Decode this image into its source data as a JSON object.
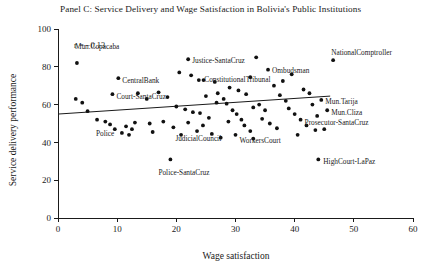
{
  "chart_data": {
    "type": "scatter",
    "title": "Panel C: Service Delivery and Wage Satisfaction in Bolivia's Public Institutions",
    "xlabel": "Wage satisfaction",
    "ylabel": "Service delivery performance",
    "xlim": [
      0,
      60
    ],
    "ylim": [
      0,
      100
    ],
    "xticks": [
      0,
      10,
      20,
      30,
      40,
      50,
      60
    ],
    "yticks": [
      0,
      20,
      40,
      60,
      80,
      100
    ],
    "grid": false,
    "legend": "none",
    "annotation": "r = −0.13",
    "trendline": {
      "x0": 0.0,
      "y0": 55.0,
      "x1": 46.0,
      "y1": 64.5
    },
    "points": [
      {
        "x": 3.2,
        "y": 82.0,
        "label": "Mun.Copacaba",
        "label_dx": -2,
        "label_dy": -17,
        "label_anchor": "start"
      },
      {
        "x": 3.0,
        "y": 63.0,
        "label": "",
        "label_dx": 0,
        "label_dy": 0,
        "label_anchor": "start"
      },
      {
        "x": 4.1,
        "y": 61.0,
        "label": "",
        "label_dx": 0,
        "label_dy": 0,
        "label_anchor": "start"
      },
      {
        "x": 5.0,
        "y": 56.5,
        "label": "",
        "label_dx": 0,
        "label_dy": 0,
        "label_anchor": "start"
      },
      {
        "x": 6.6,
        "y": 52.0,
        "label": "Police",
        "label_dx": -1,
        "label_dy": 14,
        "label_anchor": "start"
      },
      {
        "x": 8.0,
        "y": 51.0,
        "label": "",
        "label_dx": 0,
        "label_dy": 0,
        "label_anchor": "start"
      },
      {
        "x": 8.8,
        "y": 49.5,
        "label": "",
        "label_dx": 0,
        "label_dy": 0,
        "label_anchor": "start"
      },
      {
        "x": 9.6,
        "y": 47.0,
        "label": "",
        "label_dx": 0,
        "label_dy": 0,
        "label_anchor": "start"
      },
      {
        "x": 10.8,
        "y": 45.0,
        "label": "",
        "label_dx": 0,
        "label_dy": 0,
        "label_anchor": "start"
      },
      {
        "x": 10.2,
        "y": 74.0,
        "label": "CentralBank",
        "label_dx": 4,
        "label_dy": 2,
        "label_anchor": "start"
      },
      {
        "x": 9.2,
        "y": 65.5,
        "label": "Court-SantaCruz",
        "label_dx": 4,
        "label_dy": 2,
        "label_anchor": "start"
      },
      {
        "x": 13.0,
        "y": 50.5,
        "label": "",
        "label_dx": 0,
        "label_dy": 0,
        "label_anchor": "start"
      },
      {
        "x": 15.5,
        "y": 50.0,
        "label": "",
        "label_dx": 0,
        "label_dy": 0,
        "label_anchor": "start"
      },
      {
        "x": 17.8,
        "y": 51.0,
        "label": "",
        "label_dx": 0,
        "label_dy": 0,
        "label_anchor": "start"
      },
      {
        "x": 19.5,
        "y": 48.0,
        "label": "JudicialCouncil",
        "label_dx": 2,
        "label_dy": 11,
        "label_anchor": "start"
      },
      {
        "x": 20.5,
        "y": 77.0,
        "label": "",
        "label_dx": 0,
        "label_dy": 0,
        "label_anchor": "start"
      },
      {
        "x": 22.5,
        "y": 75.5,
        "label": "",
        "label_dx": 0,
        "label_dy": 0,
        "label_anchor": "start"
      },
      {
        "x": 23.8,
        "y": 73.0,
        "label": "",
        "label_dx": 0,
        "label_dy": 0,
        "label_anchor": "start"
      },
      {
        "x": 24.6,
        "y": 73.0,
        "label": "",
        "label_dx": 0,
        "label_dy": 0,
        "label_anchor": "start"
      },
      {
        "x": 22.0,
        "y": 84.0,
        "label": "Justice-SantaCruz",
        "label_dx": 4,
        "label_dy": 1,
        "label_anchor": "start"
      },
      {
        "x": 26.5,
        "y": 72.0,
        "label": "",
        "label_dx": 0,
        "label_dy": 0,
        "label_anchor": "start"
      },
      {
        "x": 27.0,
        "y": 66.0,
        "label": "",
        "label_dx": 0,
        "label_dy": 0,
        "label_anchor": "start"
      },
      {
        "x": 28.0,
        "y": 63.0,
        "label": "",
        "label_dx": 0,
        "label_dy": 0,
        "label_anchor": "start"
      },
      {
        "x": 28.5,
        "y": 60.5,
        "label": "",
        "label_dx": 0,
        "label_dy": 0,
        "label_anchor": "start"
      },
      {
        "x": 29.5,
        "y": 57.0,
        "label": "",
        "label_dx": 0,
        "label_dy": 0,
        "label_anchor": "start"
      },
      {
        "x": 30.2,
        "y": 55.0,
        "label": "",
        "label_dx": 0,
        "label_dy": 0,
        "label_anchor": "start"
      },
      {
        "x": 31.0,
        "y": 52.0,
        "label": "",
        "label_dx": 0,
        "label_dy": 0,
        "label_anchor": "start"
      },
      {
        "x": 31.5,
        "y": 49.0,
        "label": "",
        "label_dx": 0,
        "label_dy": 0,
        "label_anchor": "start"
      },
      {
        "x": 32.5,
        "y": 46.0,
        "label": "",
        "label_dx": 0,
        "label_dy": 0,
        "label_anchor": "start"
      },
      {
        "x": 30.0,
        "y": 44.0,
        "label": "WorkersCourt",
        "label_dx": 4,
        "label_dy": 6,
        "label_anchor": "start"
      },
      {
        "x": 33.0,
        "y": 42.0,
        "label": "",
        "label_dx": 0,
        "label_dy": 0,
        "label_anchor": "start"
      },
      {
        "x": 25.5,
        "y": 53.0,
        "label": "",
        "label_dx": 0,
        "label_dy": 0,
        "label_anchor": "start"
      },
      {
        "x": 24.0,
        "y": 55.5,
        "label": "",
        "label_dx": 0,
        "label_dy": 0,
        "label_anchor": "start"
      },
      {
        "x": 22.8,
        "y": 56.0,
        "label": "",
        "label_dx": 0,
        "label_dy": 0,
        "label_anchor": "start"
      },
      {
        "x": 21.5,
        "y": 57.5,
        "label": "",
        "label_dx": 0,
        "label_dy": 0,
        "label_anchor": "start"
      },
      {
        "x": 20.0,
        "y": 59.0,
        "label": "",
        "label_dx": 0,
        "label_dy": 0,
        "label_anchor": "start"
      },
      {
        "x": 26.0,
        "y": 44.5,
        "label": "",
        "label_dx": 0,
        "label_dy": 0,
        "label_anchor": "start"
      },
      {
        "x": 27.5,
        "y": 42.5,
        "label": "",
        "label_dx": 0,
        "label_dy": 0,
        "label_anchor": "start"
      },
      {
        "x": 23.5,
        "y": 46.0,
        "label": "",
        "label_dx": 0,
        "label_dy": 0,
        "label_anchor": "start"
      },
      {
        "x": 20.8,
        "y": 44.0,
        "label": "",
        "label_dx": 0,
        "label_dy": 0,
        "label_anchor": "start"
      },
      {
        "x": 19.0,
        "y": 31.0,
        "label": "Police-SantaCruz",
        "label_dx": -12,
        "label_dy": 13,
        "label_anchor": "start"
      },
      {
        "x": 33.5,
        "y": 85.0,
        "label": "",
        "label_dx": 0,
        "label_dy": 0,
        "label_anchor": "start"
      },
      {
        "x": 35.5,
        "y": 78.5,
        "label": "Ombudsman",
        "label_dx": 4,
        "label_dy": 1,
        "label_anchor": "start"
      },
      {
        "x": 32.5,
        "y": 74.5,
        "label": "ConstitutionalTribunal",
        "label_dx": -46,
        "label_dy": 2,
        "label_anchor": "start"
      },
      {
        "x": 36.5,
        "y": 70.0,
        "label": "",
        "label_dx": 0,
        "label_dy": 0,
        "label_anchor": "start"
      },
      {
        "x": 37.5,
        "y": 65.0,
        "label": "",
        "label_dx": 0,
        "label_dy": 0,
        "label_anchor": "start"
      },
      {
        "x": 38.5,
        "y": 62.0,
        "label": "",
        "label_dx": 0,
        "label_dy": 0,
        "label_anchor": "start"
      },
      {
        "x": 39.0,
        "y": 58.0,
        "label": "",
        "label_dx": 0,
        "label_dy": 0,
        "label_anchor": "start"
      },
      {
        "x": 40.0,
        "y": 55.0,
        "label": "",
        "label_dx": 0,
        "label_dy": 0,
        "label_anchor": "start"
      },
      {
        "x": 41.0,
        "y": 52.0,
        "label": "Prosecutor-SantaCruz",
        "label_dx": 4,
        "label_dy": 3,
        "label_anchor": "start"
      },
      {
        "x": 42.0,
        "y": 49.0,
        "label": "",
        "label_dx": 0,
        "label_dy": 0,
        "label_anchor": "start"
      },
      {
        "x": 43.5,
        "y": 46.5,
        "label": "",
        "label_dx": 0,
        "label_dy": 0,
        "label_anchor": "start"
      },
      {
        "x": 44.5,
        "y": 62.5,
        "label": "Mun.Tarija",
        "label_dx": 4,
        "label_dy": 2,
        "label_anchor": "start"
      },
      {
        "x": 45.5,
        "y": 57.0,
        "label": "Mun.Cliza",
        "label_dx": 4,
        "label_dy": 2,
        "label_anchor": "start"
      },
      {
        "x": 46.5,
        "y": 83.5,
        "label": "NationalComptroller",
        "label_dx": -2,
        "label_dy": -8,
        "label_anchor": "start"
      },
      {
        "x": 44.0,
        "y": 31.0,
        "label": "HighCourt-LaPaz",
        "label_dx": 5,
        "label_dy": 2,
        "label_anchor": "start"
      },
      {
        "x": 12.5,
        "y": 47.0,
        "label": "",
        "label_dx": 0,
        "label_dy": 0,
        "label_anchor": "start"
      },
      {
        "x": 11.5,
        "y": 48.5,
        "label": "",
        "label_dx": 0,
        "label_dy": 0,
        "label_anchor": "start"
      },
      {
        "x": 16.0,
        "y": 45.5,
        "label": "",
        "label_dx": 0,
        "label_dy": 0,
        "label_anchor": "start"
      },
      {
        "x": 34.0,
        "y": 60.0,
        "label": "",
        "label_dx": 0,
        "label_dy": 0,
        "label_anchor": "start"
      },
      {
        "x": 33.0,
        "y": 58.5,
        "label": "",
        "label_dx": 0,
        "label_dy": 0,
        "label_anchor": "start"
      },
      {
        "x": 35.0,
        "y": 57.0,
        "label": "",
        "label_dx": 0,
        "label_dy": 0,
        "label_anchor": "start"
      },
      {
        "x": 29.0,
        "y": 69.0,
        "label": "",
        "label_dx": 0,
        "label_dy": 0,
        "label_anchor": "start"
      },
      {
        "x": 30.5,
        "y": 67.5,
        "label": "",
        "label_dx": 0,
        "label_dy": 0,
        "label_anchor": "start"
      },
      {
        "x": 38.0,
        "y": 72.5,
        "label": "",
        "label_dx": 0,
        "label_dy": 0,
        "label_anchor": "start"
      },
      {
        "x": 41.5,
        "y": 68.0,
        "label": "",
        "label_dx": 0,
        "label_dy": 0,
        "label_anchor": "start"
      },
      {
        "x": 42.5,
        "y": 66.0,
        "label": "",
        "label_dx": 0,
        "label_dy": 0,
        "label_anchor": "start"
      },
      {
        "x": 43.0,
        "y": 60.0,
        "label": "",
        "label_dx": 0,
        "label_dy": 0,
        "label_anchor": "start"
      },
      {
        "x": 40.5,
        "y": 44.0,
        "label": "",
        "label_dx": 0,
        "label_dy": 0,
        "label_anchor": "start"
      },
      {
        "x": 37.0,
        "y": 47.5,
        "label": "",
        "label_dx": 0,
        "label_dy": 0,
        "label_anchor": "start"
      },
      {
        "x": 35.8,
        "y": 50.0,
        "label": "",
        "label_dx": 0,
        "label_dy": 0,
        "label_anchor": "start"
      },
      {
        "x": 34.5,
        "y": 52.5,
        "label": "",
        "label_dx": 0,
        "label_dy": 0,
        "label_anchor": "start"
      },
      {
        "x": 18.5,
        "y": 64.0,
        "label": "",
        "label_dx": 0,
        "label_dy": 0,
        "label_anchor": "start"
      },
      {
        "x": 17.0,
        "y": 66.5,
        "label": "",
        "label_dx": 0,
        "label_dy": 0,
        "label_anchor": "start"
      },
      {
        "x": 15.0,
        "y": 63.0,
        "label": "",
        "label_dx": 0,
        "label_dy": 0,
        "label_anchor": "start"
      },
      {
        "x": 13.5,
        "y": 66.0,
        "label": "",
        "label_dx": 0,
        "label_dy": 0,
        "label_anchor": "start"
      },
      {
        "x": 25.0,
        "y": 64.5,
        "label": "",
        "label_dx": 0,
        "label_dy": 0,
        "label_anchor": "start"
      },
      {
        "x": 26.8,
        "y": 61.0,
        "label": "",
        "label_dx": 0,
        "label_dy": 0,
        "label_anchor": "start"
      },
      {
        "x": 28.8,
        "y": 51.0,
        "label": "",
        "label_dx": 0,
        "label_dy": 0,
        "label_anchor": "start"
      },
      {
        "x": 24.5,
        "y": 49.0,
        "label": "",
        "label_dx": 0,
        "label_dy": 0,
        "label_anchor": "start"
      },
      {
        "x": 22.0,
        "y": 50.5,
        "label": "",
        "label_dx": 0,
        "label_dy": 0,
        "label_anchor": "start"
      },
      {
        "x": 31.8,
        "y": 65.5,
        "label": "",
        "label_dx": 0,
        "label_dy": 0,
        "label_anchor": "start"
      },
      {
        "x": 39.5,
        "y": 76.0,
        "label": "",
        "label_dx": 0,
        "label_dy": 0,
        "label_anchor": "start"
      },
      {
        "x": 43.8,
        "y": 54.0,
        "label": "",
        "label_dx": 0,
        "label_dy": 0,
        "label_anchor": "start"
      },
      {
        "x": 45.0,
        "y": 47.0,
        "label": "",
        "label_dx": 0,
        "label_dy": 0,
        "label_anchor": "start"
      },
      {
        "x": 12.0,
        "y": 44.0,
        "label": "",
        "label_dx": 0,
        "label_dy": 0,
        "label_anchor": "start"
      }
    ]
  }
}
